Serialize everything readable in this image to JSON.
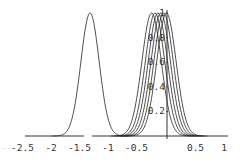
{
  "chart_data": {
    "type": "line",
    "title": "",
    "xlabel": "",
    "ylabel": "",
    "xlim": [
      -2.7,
      1.05
    ],
    "ylim": [
      0,
      1.0
    ],
    "grid": false,
    "legend": null,
    "x_ticks": [
      "-2.5",
      "-2",
      "-1.5",
      "-1",
      "-0.5",
      "0.5",
      "1"
    ],
    "x_tick_values": [
      -2.5,
      -2,
      -1.5,
      -1,
      -0.5,
      0.5,
      1
    ],
    "y_ticks": [
      "0.2",
      "0.4",
      "0.6",
      "0.8",
      "1"
    ],
    "y_tick_values": [
      0.2,
      0.4,
      0.6,
      0.8,
      1.0
    ],
    "series": [
      {
        "name": "curve-1",
        "shape": "gaussian",
        "mean": -1.35,
        "sigma": 0.16,
        "peak": 1.0
      },
      {
        "name": "curve-2",
        "shape": "gaussian",
        "mean": -0.27,
        "sigma": 0.17,
        "peak": 1.0
      },
      {
        "name": "curve-3",
        "shape": "gaussian",
        "mean": -0.21,
        "sigma": 0.17,
        "peak": 1.0
      },
      {
        "name": "curve-4",
        "shape": "gaussian",
        "mean": -0.16,
        "sigma": 0.17,
        "peak": 1.0
      },
      {
        "name": "curve-5",
        "shape": "gaussian",
        "mean": -0.11,
        "sigma": 0.17,
        "peak": 1.0
      },
      {
        "name": "curve-6",
        "shape": "gaussian",
        "mean": -0.06,
        "sigma": 0.17,
        "peak": 1.0
      },
      {
        "name": "curve-7",
        "shape": "gaussian",
        "mean": -0.01,
        "sigma": 0.17,
        "peak": 1.0
      }
    ],
    "layout": {
      "origin_px": [
        167,
        136
      ],
      "px_per_unit_x": 57,
      "px_per_unit_y": 123,
      "axis_color": "#333333",
      "curve_color": "#222222"
    }
  }
}
